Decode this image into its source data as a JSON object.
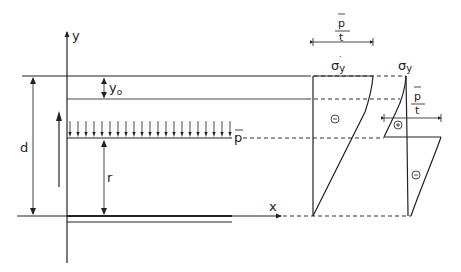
{
  "labels": {
    "y_axis": "y",
    "x_axis": "x",
    "depth": "d",
    "offset": "y",
    "offset_sub": "o",
    "radius": "r",
    "load": "p",
    "sigma_y_prime": "σ",
    "sigma_y_prime_sub": "y",
    "sigma_y_prime_mark": "′",
    "sigma_y": "σ",
    "sigma_y_sub": "y",
    "fraction_top_1": "p",
    "fraction_bottom_1": "t",
    "fraction_top_2": "p",
    "fraction_bottom_2": "t",
    "sign_minus_1": "−",
    "sign_plus": "+",
    "sign_minus_2": "−"
  },
  "load_arrow_count": 21
}
